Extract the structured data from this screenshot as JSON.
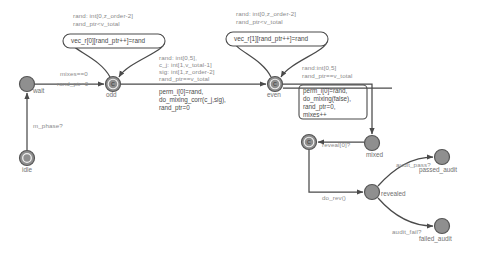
{
  "diagram": {
    "colors": {
      "state_fill": "#8f8f8f",
      "state_stroke": "#555555",
      "edge": "#4a4a4a",
      "guard_text": "#8a8a8a",
      "action_text": "#4a4a4a",
      "background": "#ffffff"
    },
    "states": [
      {
        "id": "idle",
        "label": "idle",
        "kind": "initial",
        "cx": 27,
        "cy": 158,
        "r": 7.5
      },
      {
        "id": "wait",
        "label": "wait",
        "kind": "normal",
        "cx": 27,
        "cy": 84,
        "r": 7.5
      },
      {
        "id": "odd",
        "label": "odd",
        "kind": "committed",
        "cx": 113,
        "cy": 84,
        "r": 7.5
      },
      {
        "id": "even",
        "label": "even",
        "kind": "committed",
        "cx": 275,
        "cy": 84,
        "r": 7.5
      },
      {
        "id": "mixed",
        "label": "mixed",
        "kind": "normal",
        "cx": 372,
        "cy": 143,
        "r": 7.5
      },
      {
        "id": "commit_rev",
        "label": "",
        "kind": "committed",
        "cx": 309,
        "cy": 142,
        "r": 7.5
      },
      {
        "id": "revealed",
        "label": "revealed",
        "kind": "normal",
        "cx": 372,
        "cy": 192,
        "r": 7.5
      },
      {
        "id": "passed_audit",
        "label": "passed_audit",
        "kind": "normal",
        "cx": 442,
        "cy": 157,
        "r": 7.5
      },
      {
        "id": "failed_audit",
        "label": "failed_audit",
        "kind": "normal",
        "cx": 442,
        "cy": 226,
        "r": 7.5
      }
    ],
    "self_loops": [
      {
        "id": "odd_loop",
        "on_state": "odd",
        "guard_lines": [
          "rand: int[0,z_order-2]",
          "rand_ptr<v_total"
        ],
        "action": "vec_r[0][rand_ptr++]=rand"
      },
      {
        "id": "even_loop",
        "on_state": "even",
        "guard_lines": [
          "rand: int[0,z_order-2]",
          "rand_ptr<v_total"
        ],
        "action": "vec_r[1][rand_ptr++]=rand"
      }
    ],
    "transitions": [
      {
        "id": "idle-to-wait",
        "from": "idle",
        "to": "wait",
        "guard_lines": [
          "m_phase?"
        ],
        "action_lines": []
      },
      {
        "id": "wait-to-odd",
        "from": "wait",
        "to": "odd",
        "guard_lines": [
          "mixes==0"
        ],
        "action_lines": [
          "rand_ptr=0"
        ]
      },
      {
        "id": "odd-to-even",
        "from": "odd",
        "to": "even",
        "guard_lines": [
          "rand: int[0,5],",
          "c_j: int[1,v_total-1]",
          "sig: int[1,z_order-2]",
          "rand_ptr==v_total"
        ],
        "action_lines": [
          "perm_i[0]=rand,",
          "do_mixing_corr(c_j,sig),",
          "rand_ptr=0"
        ]
      },
      {
        "id": "even-to-mixed",
        "from": "even",
        "to": "mixed",
        "guard_lines": [
          "rand:int[0,5]",
          "rand_ptr==v_total"
        ],
        "action_lines": [
          "perm_i[0]=rand,",
          "do_mixing(false),",
          "rand_ptr=0,",
          "mixes++"
        ]
      },
      {
        "id": "mixed-to-commit",
        "from": "mixed",
        "to": "commit_rev",
        "guard_lines": [
          "reveal[0]?"
        ],
        "action_lines": []
      },
      {
        "id": "commit-to-revealed",
        "from": "commit_rev",
        "to": "revealed",
        "guard_lines": [],
        "action_lines": [
          "do_rev()"
        ]
      },
      {
        "id": "revealed-to-passed",
        "from": "revealed",
        "to": "passed_audit",
        "guard_lines": [
          "audit_pass?"
        ],
        "action_lines": []
      },
      {
        "id": "revealed-to-failed",
        "from": "revealed",
        "to": "failed_audit",
        "guard_lines": [
          "audit_fail?"
        ],
        "action_lines": []
      },
      {
        "id": "even-back-to-wait",
        "from": "even",
        "to": "wait",
        "guard_lines": [],
        "action_lines": []
      }
    ],
    "committed_marker": "C"
  }
}
